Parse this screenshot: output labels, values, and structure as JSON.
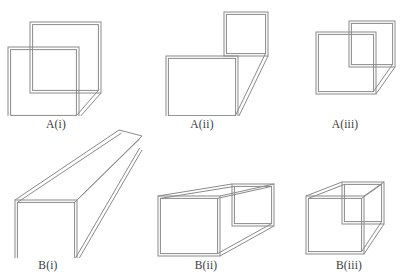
{
  "page": {
    "background_color": "#ffffff",
    "stroke_color": "#8a8a8a",
    "label_color": "#3a3a3a"
  },
  "figures": [
    {
      "id": "a-i",
      "label": "A(i)",
      "row": "A",
      "index": 1,
      "description": "Two overlapping open squares joined by a short diagonal at the lower right"
    },
    {
      "id": "a-ii",
      "label": "A(ii)",
      "row": "A",
      "index": 2,
      "description": "Two separated squares, small upper-right square and large lower-left square, joined by a long diagonal"
    },
    {
      "id": "a-iii",
      "label": "A(iii)",
      "row": "A",
      "index": 3,
      "description": "Two overlapping squares with the smaller square offset up and to the right, joined by a short diagonal"
    },
    {
      "id": "b-i",
      "label": "B(i)",
      "row": "B",
      "index": 1,
      "description": "Long square prism in perspective receding to the upper right, far end off-frame"
    },
    {
      "id": "b-ii",
      "label": "B(ii)",
      "row": "B",
      "index": 2,
      "description": "Short square prism in perspective, open near face and visible far square face at right"
    },
    {
      "id": "b-iii",
      "label": "B(iii)",
      "row": "B",
      "index": 3,
      "description": "Very short square prism, nearly a cube, in perspective receding to the upper right"
    }
  ],
  "labels": {
    "a_i": "A(i)",
    "a_ii": "A(ii)",
    "a_iii": "A(iii)",
    "b_i": "B(i)",
    "b_ii": "B(ii)",
    "b_iii": "B(iii)"
  }
}
